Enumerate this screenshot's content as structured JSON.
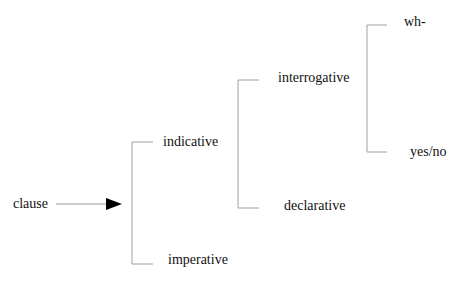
{
  "diagram": {
    "type": "system-network",
    "entry": {
      "label": "clause"
    },
    "systems": [
      {
        "id": "mood",
        "options": [
          {
            "label": "indicative"
          },
          {
            "label": "imperative"
          }
        ]
      },
      {
        "id": "indicative-type",
        "options": [
          {
            "label": "interrogative"
          },
          {
            "label": "declarative"
          }
        ]
      },
      {
        "id": "interrogative-type",
        "options": [
          {
            "label": "wh-"
          },
          {
            "label": "yes/no"
          }
        ]
      }
    ],
    "colors": {
      "line": "#9a9a9a",
      "arrow": "#000000",
      "text": "#111111"
    }
  }
}
